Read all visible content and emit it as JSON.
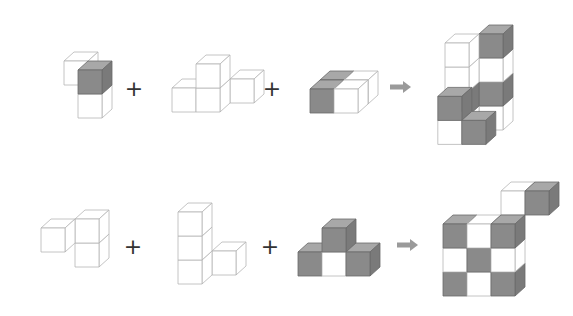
{
  "colors": {
    "shaded_front": "#8a8a8a",
    "shaded_top": "#a8a8a8",
    "shaded_side": "#7a7a7a",
    "white_face": "#ffffff",
    "outline": "#b5b5b5",
    "outline_dark": "#555555",
    "arrow": "#9a9a9a",
    "plus": "#333333"
  },
  "operators": {
    "plus": "+",
    "arrow": "arrow-right"
  },
  "rows": [
    {
      "name": "row-1",
      "pieces": [
        {
          "name": "piece-1",
          "cubes": [
            {
              "x": 0,
              "y": 1,
              "z": 1,
              "shade": "white"
            },
            {
              "x": 1,
              "y": 0,
              "z": 0,
              "shade": "white"
            },
            {
              "x": 1,
              "y": 1,
              "z": 0,
              "shade": "gray"
            }
          ]
        },
        {
          "name": "piece-2",
          "cubes": [
            {
              "x": 2,
              "y": 0,
              "z": 1,
              "shade": "white"
            },
            {
              "x": 0,
              "y": 0,
              "z": 0,
              "shade": "white"
            },
            {
              "x": 1,
              "y": 0,
              "z": 0,
              "shade": "white"
            },
            {
              "x": 1,
              "y": 1,
              "z": 0,
              "shade": "white"
            }
          ]
        },
        {
          "name": "piece-3",
          "cubes": [
            {
              "x": 0,
              "y": 0,
              "z": 1,
              "shade": "gray"
            },
            {
              "x": 1,
              "y": 0,
              "z": 1,
              "shade": "white"
            },
            {
              "x": 0,
              "y": 0,
              "z": 0,
              "shade": "gray"
            },
            {
              "x": 1,
              "y": 0,
              "z": 0,
              "shade": "white"
            }
          ]
        }
      ],
      "result": {
        "name": "result-1",
        "cubes": [
          {
            "x": 1,
            "y": 0,
            "z": 1,
            "shade": "white"
          },
          {
            "x": 1,
            "y": 1,
            "z": 1,
            "shade": "gray"
          },
          {
            "x": 1,
            "y": 2,
            "z": 1,
            "shade": "white"
          },
          {
            "x": 1,
            "y": 3,
            "z": 1,
            "shade": "gray"
          },
          {
            "x": 0,
            "y": 0,
            "z": 0,
            "shade": "white"
          },
          {
            "x": 0,
            "y": 1,
            "z": 0,
            "shade": "gray"
          },
          {
            "x": 0,
            "y": 2,
            "z": 0,
            "shade": "white"
          },
          {
            "x": 0,
            "y": 3,
            "z": 0,
            "shade": "white"
          },
          {
            "x": -0.05,
            "y": 1,
            "z": -0.6,
            "shade": "gray"
          },
          {
            "x": -0.05,
            "y": 0,
            "z": -0.6,
            "shade": "white"
          },
          {
            "x": 0.95,
            "y": 0,
            "z": -0.6,
            "shade": "gray"
          }
        ]
      }
    },
    {
      "name": "row-2",
      "pieces": [
        {
          "name": "piece-4",
          "cubes": [
            {
              "x": 1,
              "y": 0,
              "z": 1,
              "shade": "white"
            },
            {
              "x": 1,
              "y": 1,
              "z": 1,
              "shade": "white"
            },
            {
              "x": 0,
              "y": 1,
              "z": 0,
              "shade": "white"
            }
          ]
        },
        {
          "name": "piece-5",
          "cubes": [
            {
              "x": 1,
              "y": 0,
              "z": 1,
              "shade": "white"
            },
            {
              "x": 0,
              "y": 0,
              "z": 0,
              "shade": "white"
            },
            {
              "x": 0,
              "y": 1,
              "z": 0,
              "shade": "white"
            },
            {
              "x": 0,
              "y": 2,
              "z": 0,
              "shade": "white"
            }
          ]
        },
        {
          "name": "piece-6",
          "cubes": [
            {
              "x": 0,
              "y": 0,
              "z": 0,
              "shade": "gray"
            },
            {
              "x": 1,
              "y": 0,
              "z": 0,
              "shade": "white"
            },
            {
              "x": 2,
              "y": 0,
              "z": 0,
              "shade": "gray"
            },
            {
              "x": 1,
              "y": 1,
              "z": 0,
              "shade": "gray"
            }
          ]
        }
      ],
      "result": {
        "name": "result-2",
        "cubes": [
          {
            "x": 0,
            "y": 0,
            "z": 0,
            "shade": "gray"
          },
          {
            "x": 1,
            "y": 0,
            "z": 0,
            "shade": "white"
          },
          {
            "x": 2,
            "y": 0,
            "z": 0,
            "shade": "gray"
          },
          {
            "x": 0,
            "y": 1,
            "z": 0,
            "shade": "white"
          },
          {
            "x": 1,
            "y": 1,
            "z": 0,
            "shade": "gray"
          },
          {
            "x": 2,
            "y": 1,
            "z": 0,
            "shade": "white"
          },
          {
            "x": 0,
            "y": 2,
            "z": 0,
            "shade": "gray"
          },
          {
            "x": 1,
            "y": 2,
            "z": 0,
            "shade": "white"
          },
          {
            "x": 2,
            "y": 2,
            "z": 0,
            "shade": "gray"
          },
          {
            "x": 2,
            "y": 3,
            "z": 1,
            "shade": "white"
          },
          {
            "x": 3,
            "y": 3,
            "z": 1,
            "shade": "gray"
          }
        ]
      }
    }
  ]
}
